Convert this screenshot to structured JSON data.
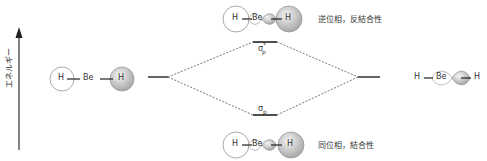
{
  "diagram": {
    "type": "molecular-orbital-energy-diagram",
    "axis": {
      "label": "エネルギー"
    },
    "left_molecule": {
      "atoms": [
        "H",
        "Be",
        "H"
      ]
    },
    "right_molecule": {
      "atoms": [
        "H",
        "Be",
        "H"
      ]
    },
    "antibonding": {
      "symbol": "σ",
      "subscript": "p",
      "superscript": "*",
      "atoms": [
        "H",
        "Be",
        "H"
      ],
      "description": "逆位相，反結合性"
    },
    "bonding": {
      "symbol": "σ",
      "subscript": "p",
      "atoms": [
        "H",
        "Be",
        "H"
      ],
      "description": "同位相，結合性"
    },
    "colors": {
      "line": "#222222",
      "dash": "#555555",
      "orbital_fill": "#d0d0d0",
      "orbital_stroke": "#999999"
    }
  }
}
